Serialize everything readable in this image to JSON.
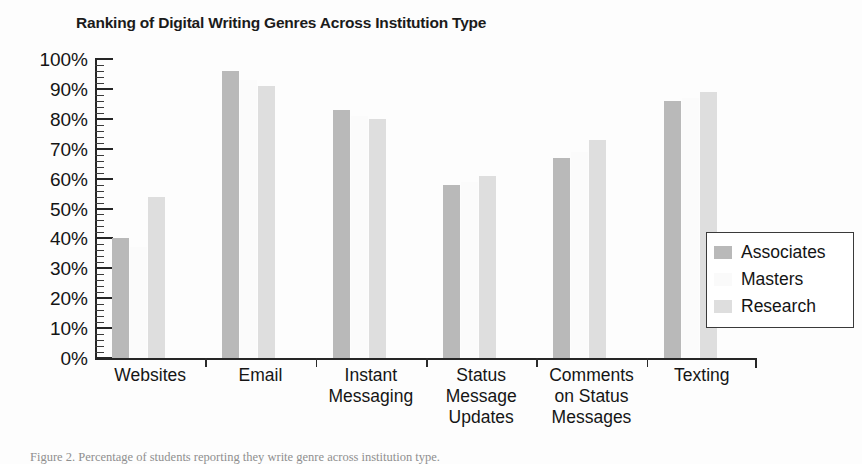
{
  "chart_data": {
    "type": "bar",
    "title": "Ranking of Digital Writing Genres Across Institution Type",
    "xlabel": "",
    "ylabel": "",
    "ylim": [
      0,
      100
    ],
    "y_tick_suffix": "%",
    "y_tick_step": 10,
    "y_minor_step": 2,
    "grid": false,
    "legend_position": "right",
    "categories": [
      "Websites",
      "Email",
      "Instant Messaging",
      "Status Message Updates",
      "Comments on Status Messages",
      "Texting"
    ],
    "category_lines": [
      [
        "Websites"
      ],
      [
        "Email"
      ],
      [
        "Instant",
        "Messaging"
      ],
      [
        "Status",
        "Message",
        "Updates"
      ],
      [
        "Comments",
        "on Status",
        "Messages"
      ],
      [
        "Texting"
      ]
    ],
    "series": [
      {
        "name": "Associates",
        "color": "#b9b9b9",
        "values": [
          40,
          96,
          83,
          58,
          67,
          86
        ]
      },
      {
        "name": "Masters",
        "color": "#fbfbfb",
        "values": [
          37,
          93,
          81,
          59,
          69,
          87
        ]
      },
      {
        "name": "Research",
        "color": "#dedede",
        "values": [
          54,
          91,
          80,
          61,
          73,
          89
        ]
      }
    ],
    "y_ticks": [
      "0%",
      "10%",
      "20%",
      "30%",
      "40%",
      "50%",
      "60%",
      "70%",
      "80%",
      "90%",
      "100%"
    ]
  },
  "legend": {
    "items": [
      {
        "label": "Associates",
        "swatch": "#b9b9b9"
      },
      {
        "label": "Masters",
        "swatch": "#fafafa"
      },
      {
        "label": "Research",
        "swatch": "#dedede"
      }
    ]
  },
  "caption": {
    "text": "Figure 2. Percentage of students reporting they write genre across institution type."
  }
}
